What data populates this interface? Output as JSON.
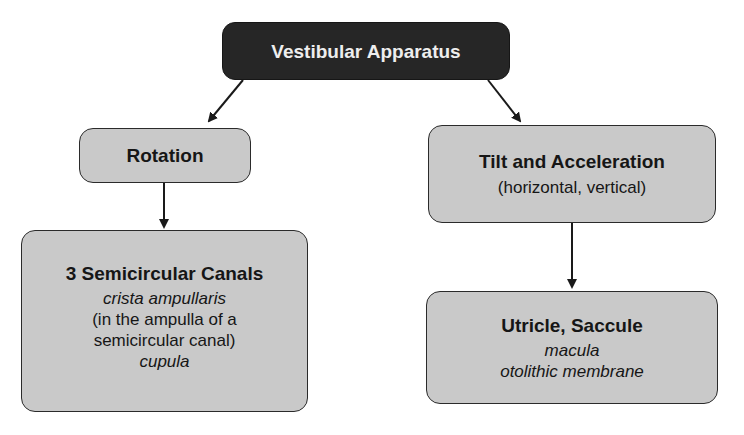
{
  "diagram": {
    "root": {
      "title": "Vestibular Apparatus"
    },
    "left_branch": {
      "node": {
        "title": "Rotation"
      },
      "child": {
        "title": "3 Semicircular Canals",
        "lines": [
          {
            "text": "crista ampullaris",
            "italic": true
          },
          {
            "text": "(in the ampulla of a",
            "italic": false
          },
          {
            "text": "semicircular canal)",
            "italic": false
          },
          {
            "text": "cupula",
            "italic": true
          }
        ]
      }
    },
    "right_branch": {
      "node": {
        "title": "Tilt and Acceleration",
        "subtitle": "(horizontal, vertical)"
      },
      "child": {
        "title": "Utricle, Saccule",
        "lines": [
          {
            "text": "macula",
            "italic": true
          },
          {
            "text": "otolithic membrane",
            "italic": true
          }
        ]
      }
    },
    "edges": [
      {
        "from": "Vestibular Apparatus",
        "to": "Rotation"
      },
      {
        "from": "Vestibular Apparatus",
        "to": "Tilt and Acceleration"
      },
      {
        "from": "Rotation",
        "to": "3 Semicircular Canals"
      },
      {
        "from": "Tilt and Acceleration",
        "to": "Utricle, Saccule"
      }
    ],
    "colors": {
      "root_fill": "#262626",
      "root_text": "#eeeeee",
      "node_fill": "#c9c9c9",
      "border": "#2b2b2b",
      "arrow": "#1a1a1a"
    }
  }
}
